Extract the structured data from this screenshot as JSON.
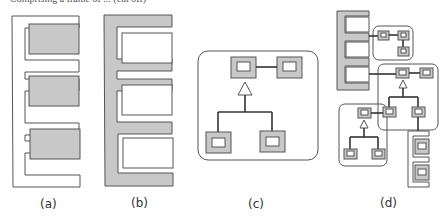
{
  "top_text": "Comprising a frame of ... (cut off)",
  "panels": [
    {
      "id": "a",
      "label": "(a)",
      "description": "White E-shaped frame holding three gray filled slots"
    },
    {
      "id": "b",
      "label": "(b)",
      "description": "Gray E-shaped frame holding three white empty slots"
    },
    {
      "id": "c",
      "label": "(c)",
      "description": "Rounded container with class hierarchy: parent node linked to sibling node, inheritance triangle to two child nodes"
    },
    {
      "id": "d",
      "label": "(d)",
      "description": "Composite: gray E-frame slots connected to nested rounded containers with node hierarchies and a small white E-frame with gray slots"
    }
  ],
  "colors": {
    "stroke": "#555555",
    "fill_gray": "#c8c8c8",
    "fill_white": "#ffffff",
    "label": "#333333"
  }
}
